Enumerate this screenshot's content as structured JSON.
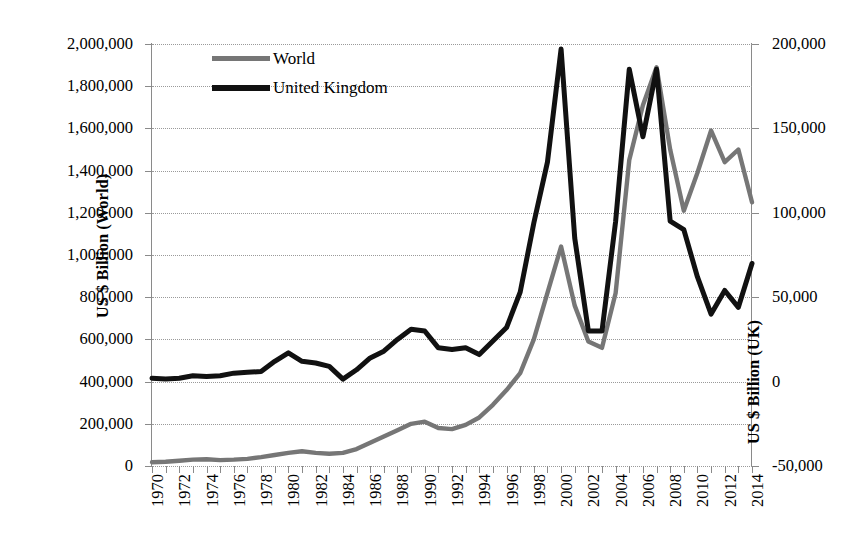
{
  "chart_data": {
    "type": "line",
    "title": "",
    "xlabel": "",
    "ylabel": "US $ Billion (World)",
    "ylabel_right": "US $ Billion (UK)",
    "grid": true,
    "legend_position": "top-left-inside",
    "x": [
      1970,
      1971,
      1972,
      1973,
      1974,
      1975,
      1976,
      1977,
      1978,
      1979,
      1980,
      1981,
      1982,
      1983,
      1984,
      1985,
      1986,
      1987,
      1988,
      1989,
      1990,
      1991,
      1992,
      1993,
      1994,
      1995,
      1996,
      1997,
      1998,
      1999,
      2000,
      2001,
      2002,
      2003,
      2004,
      2005,
      2006,
      2007,
      2008,
      2009,
      2010,
      2011,
      2012,
      2013,
      2014
    ],
    "x_tick_labels": [
      "1970",
      "1972",
      "1974",
      "1976",
      "1978",
      "1980",
      "1982",
      "1984",
      "1986",
      "1988",
      "1990",
      "1992",
      "1994",
      "1996",
      "1998",
      "2000",
      "2002",
      "2004",
      "2006",
      "2008",
      "2010",
      "2012",
      "2014"
    ],
    "ylim": [
      0,
      2000000
    ],
    "y_ticks": [
      0,
      200000,
      400000,
      600000,
      800000,
      1000000,
      1200000,
      1400000,
      1600000,
      1800000,
      2000000
    ],
    "y_tick_labels": [
      "0",
      "200,000",
      "400,000",
      "600,000",
      "800,000",
      "1,000,000",
      "1,200,000",
      "1,400,000",
      "1,600,000",
      "1,800,000",
      "2,000,000"
    ],
    "ylim_right": [
      -50000,
      200000
    ],
    "y_ticks_right": [
      -50000,
      0,
      50000,
      100000,
      150000,
      200000
    ],
    "y_tick_labels_right": [
      "-50,000",
      "0",
      "50,000",
      "100,000",
      "150,000",
      "200,000"
    ],
    "series": [
      {
        "name": "World",
        "color": "#767676",
        "axis": "left",
        "values": [
          18000,
          20000,
          25000,
          30000,
          32000,
          28000,
          30000,
          34000,
          42000,
          52000,
          62000,
          70000,
          62000,
          58000,
          62000,
          80000,
          110000,
          140000,
          170000,
          200000,
          210000,
          180000,
          175000,
          195000,
          230000,
          290000,
          360000,
          440000,
          600000,
          820000,
          1040000,
          760000,
          590000,
          560000,
          820000,
          1450000,
          1710000,
          1890000,
          1500000,
          1210000,
          1390000,
          1590000,
          1440000,
          1500000,
          1250000
        ]
      },
      {
        "name": "United Kingdom",
        "color": "#111111",
        "axis": "right",
        "values": [
          2000,
          1500,
          2000,
          3500,
          3000,
          3500,
          5000,
          5500,
          6000,
          12000,
          17000,
          12000,
          11000,
          9000,
          1500,
          7000,
          14000,
          18000,
          25000,
          31000,
          30000,
          20000,
          19000,
          20000,
          16000,
          24000,
          32000,
          53000,
          94000,
          130000,
          197000,
          85000,
          30000,
          30000,
          95000,
          185000,
          145000,
          185000,
          95000,
          90000,
          62000,
          40000,
          54000,
          44000,
          70000
        ]
      }
    ]
  },
  "legend": {
    "items": [
      {
        "label": "World"
      },
      {
        "label": "United Kingdom"
      }
    ]
  },
  "axes": {
    "left_title": "US $ Billion (World)",
    "right_title": "US $ Billion (UK)"
  }
}
